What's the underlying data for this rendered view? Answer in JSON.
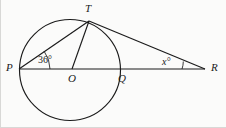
{
  "figure": {
    "background_color": "#fbfbfa",
    "stroke_color": "#1a1a1a",
    "points": {
      "P": {
        "label": "P",
        "x": 19,
        "y": 69
      },
      "T": {
        "label": "T",
        "x": 89,
        "y": 21
      },
      "O": {
        "label": "O",
        "x": 72,
        "y": 69
      },
      "Q": {
        "label": "Q",
        "x": 121,
        "y": 69
      },
      "R": {
        "label": "R",
        "x": 205,
        "y": 69
      }
    },
    "point_labels": [
      {
        "name": "P",
        "text": "P",
        "x": 6,
        "y": 62
      },
      {
        "name": "T",
        "text": "T",
        "x": 85,
        "y": 3
      },
      {
        "name": "O",
        "text": "O",
        "x": 68,
        "y": 73
      },
      {
        "name": "Q",
        "text": "Q",
        "x": 118,
        "y": 73
      },
      {
        "name": "R",
        "text": "R",
        "x": 211,
        "y": 62
      }
    ],
    "circle": {
      "cx": 70,
      "cy": 70,
      "r": 50.5
    },
    "segments": [
      {
        "name": "segment-PR",
        "from": "P",
        "to": "R"
      },
      {
        "name": "segment-PT",
        "from": "P",
        "to": "T"
      },
      {
        "name": "segment-OT",
        "from": "O",
        "to": "T"
      },
      {
        "name": "segment-TR",
        "from": "T",
        "to": "R"
      }
    ],
    "angles": [
      {
        "name": "angle-at-P",
        "vertex": "P",
        "value": "36",
        "unit": "°",
        "text": "36°",
        "label_x": 38,
        "label_y": 55
      },
      {
        "name": "angle-at-R",
        "vertex": "R",
        "value": "x",
        "unit": "°",
        "text": "x°",
        "label_x": 162,
        "label_y": 57
      }
    ]
  }
}
